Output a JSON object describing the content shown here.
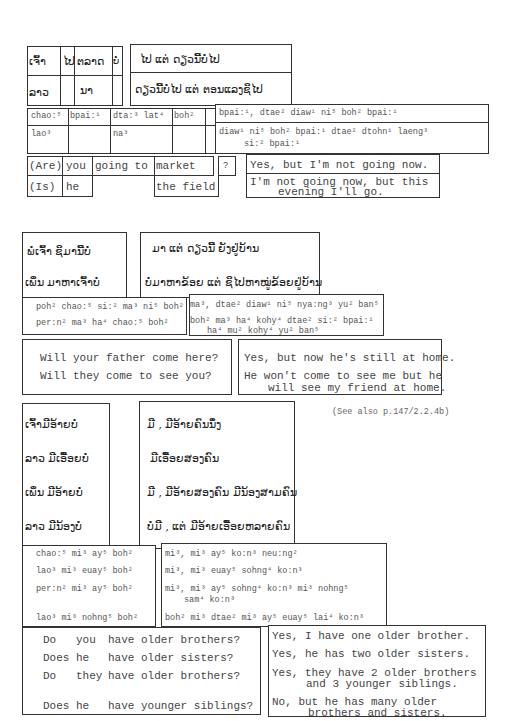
{
  "section1": {
    "lao_words_row1": [
      "ເຈົ້າ",
      "ໄປ",
      "ຕລາດ",
      "ບໍ່"
    ],
    "lao_words_row2": [
      "ລາວ",
      "",
      "ນາ",
      ""
    ],
    "lao_answer1": "ໄປ ແຕ່ ດຽວນີ້ບໍ່ໄປ",
    "lao_answer2": "ດຽວນີ້ບໍ່ໄປ ແຕ່ ຕອນແລງຊິໄປ",
    "rom_row1": [
      "chao:⁵",
      "bpai:¹",
      "dta:³ lat⁴",
      "boh²"
    ],
    "rom_row2": [
      "lao³",
      "",
      "na³",
      ""
    ],
    "rom_answer1": "bpai:¹, dtae² diaw¹ ni⁵ boh² bpai:¹",
    "rom_answer2_line1": "diaw¹ ni⁵ boh² bpai:¹ dtae² dtohn¹ laeng³",
    "rom_answer2_line2": "si:² bpai:¹",
    "eng_row1": [
      "(Are)",
      "you",
      "going to",
      "market",
      "?"
    ],
    "eng_row2": [
      "(Is)",
      "he",
      "",
      "the field",
      ""
    ],
    "eng_answer1": "Yes, but I'm not going now.",
    "eng_answer2_line1": "I'm not going now, but this",
    "eng_answer2_line2": "evening I'll go."
  },
  "section2": {
    "lao_q1": "ພໍ່ເຈົ້າ ຊິມານີ້ບໍ່",
    "lao_q2": "ເພິ່ນ ມາຫາເຈົ້າບໍ່",
    "lao_a1": "ມາ ແຕ່ ດຽວນີ້ ຍັງຢູ່ບ້ານ",
    "lao_a2": "ບໍ່ມາຫາຂ້ອຍ ແຕ່ ຊິໄປຫາໝູ່ຂ້ອຍຢູ່ບ້ານ",
    "rom_q1": "poh² chao:⁵ si:² ma³ ni⁵ boh²",
    "rom_q2": "per:n² ma³ ha⁴ chao:⁵ boh²",
    "rom_a1": "ma³, dtae² diaw¹ ni⁵ nya:ng³  yu² ban⁵",
    "rom_a2_line1": "boh² ma³ ha⁴ kohy⁴ dtae² si:² bpai:¹",
    "rom_a2_line2": "ha⁴ mu² kohy⁴ yu² ban⁵",
    "eng_q1": "Will your father come here?",
    "eng_q2": "Will they come to see you?",
    "eng_a1": "Yes, but now he's still at home.",
    "eng_a2_line1": "He won't come to see me but he",
    "eng_a2_line2": "will see my friend at home."
  },
  "section3": {
    "note": "(See also p.147/2.2.4b)",
    "lao_q": [
      "ເຈົ້າມີອ້າຍບໍ່",
      "ລາວ ມີເອື້ອຍບໍ່",
      "ເພິ່ນ ມີອ້າຍບໍ່",
      "ລາວ ມີນ້ອງບໍ່"
    ],
    "lao_a": [
      "ມີ , ມີອ້າຍຄົນນຶ່ງ",
      "ມີເອື້ອຍສອງຄົນ",
      "ມີ , ມີອ້າຍສອງຄົນ ມີນ້ອງສາມຄົນ",
      "ບໍ່ມີ , ແຕ່ ມີອ້າຍເອື້ອຍຫລາຍຄົນ"
    ],
    "rom_q": [
      "chao:⁵ mi³ ay⁵ boh²",
      "lao³ mi³ euay⁵ boh²",
      "per:n² mi³ ay⁵ boh²",
      "lao³ mi³ nohng⁵ boh²"
    ],
    "rom_a": [
      "mi³, mi³ ay⁵ ko:n³ neu:ng²",
      "mi³, mi³ euay⁵ sohng⁴ ko:n³",
      "mi³, mi³ ay⁵ sohng⁴ ko:n³ mi³ nohng⁵",
      "boh² mi³ dtae² mi³ ay⁵ euay⁵ lai⁴ ko:n³"
    ],
    "rom_a3_line2": "sam⁴ ko:n³",
    "eng_q": [
      {
        "w1": "Do",
        "w2": "you",
        "rest": "have older brothers?"
      },
      {
        "w1": "Does",
        "w2": "he",
        "rest": "have older sisters?"
      },
      {
        "w1": "Do",
        "w2": "they",
        "rest": "have older brothers?"
      },
      {
        "w1": "Does",
        "w2": "he",
        "rest": "have younger siblings?"
      }
    ],
    "eng_a": [
      "Yes, I have one older brother.",
      "Yes, he has two older sisters.",
      "Yes, they have 2 older brothers",
      "No, but he has many older"
    ],
    "eng_a3_line2": "and 3 younger siblings.",
    "eng_a4_line2": "brothers and sisters."
  }
}
